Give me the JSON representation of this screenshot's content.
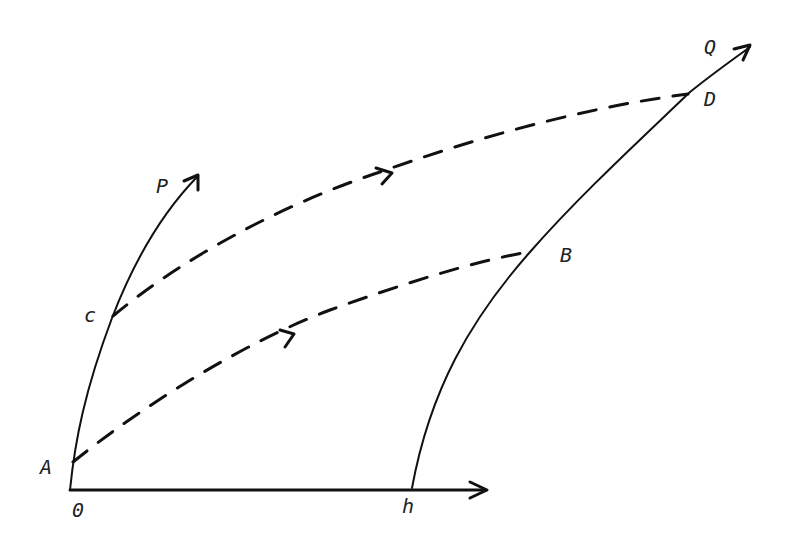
{
  "diagram": {
    "type": "characteristic-curves",
    "labels": {
      "origin": "0",
      "h": "h",
      "A": "A",
      "c": "c",
      "P": "P",
      "B": "B",
      "D": "D",
      "Q": "Q"
    },
    "curves": [
      {
        "name": "x-axis",
        "from": "0",
        "to": "beyond h",
        "style": "solid-arrow"
      },
      {
        "name": "curve-OP",
        "passes": [
          "0",
          "A",
          "c"
        ],
        "ends": "P",
        "style": "solid-arrow"
      },
      {
        "name": "curve-hQ",
        "passes": [
          "h",
          "B",
          "D"
        ],
        "ends": "Q",
        "style": "solid-arrow"
      },
      {
        "name": "path-AB",
        "from": "A",
        "to": "B",
        "style": "dashed-with-direction-arrow"
      },
      {
        "name": "path-cD",
        "from": "c",
        "to": "D",
        "style": "dashed-with-direction-arrow"
      }
    ],
    "colors": {
      "ink": "#111111",
      "background": "#ffffff"
    }
  }
}
